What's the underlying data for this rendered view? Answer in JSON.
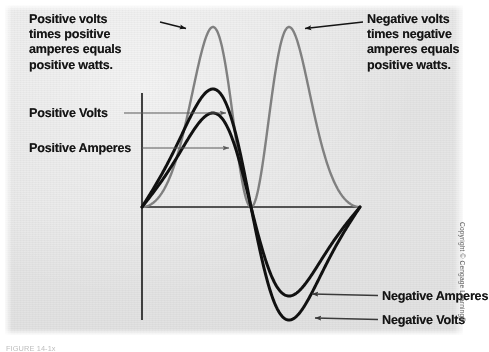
{
  "figure": {
    "background_color": "#e5e5e5",
    "page_color": "#ffffff",
    "copyright": "Copyright © Cengage Learning®",
    "caption": "FIGURE 14-1x"
  },
  "annotations": {
    "positive_watts": "Positive volts\ntimes positive\namperes equals\npositive watts.",
    "negative_watts": "Negative volts\ntimes negative\namperes equals\npositive watts.",
    "positive_volts": "Positive Volts",
    "positive_amperes": "Positive Amperes",
    "negative_amperes": "Negative Amperes",
    "negative_volts": "Negative Volts"
  },
  "chart_data": {
    "type": "line",
    "title": "",
    "xlabel": "",
    "ylabel": "",
    "grid": false,
    "legend": "annotations",
    "axes": {
      "origin_px": [
        142,
        207
      ],
      "x_axis_px": [
        142,
        360
      ],
      "y_axis_px": [
        93,
        320
      ],
      "x_range_deg": [
        0,
        360
      ],
      "y_range": [
        -1.15,
        1.15
      ],
      "axis_color": "#222222"
    },
    "series": [
      {
        "name": "Volts",
        "color": "#111111",
        "line_width_px": 3.0,
        "waveform": "sine",
        "amplitude": 1.0,
        "peak_px": [
          195,
          89
        ],
        "trough_px": [
          297,
          320
        ],
        "zero_crossings_px": [
          142,
          245,
          360
        ]
      },
      {
        "name": "Amperes",
        "color": "#111111",
        "line_width_px": 3.0,
        "waveform": "sine",
        "amplitude": 0.8,
        "peak_px": [
          195,
          113
        ],
        "trough_px": [
          293,
          296
        ],
        "zero_crossings_px": [
          142,
          245,
          360
        ]
      },
      {
        "name": "Watts",
        "color": "#808080",
        "line_width_px": 2.4,
        "waveform": "sine-squared (volts x amperes)",
        "amplitude": 1.0,
        "peaks_px": [
          [
            193,
            27
          ],
          [
            298,
            27
          ]
        ],
        "zero_crossings_px": [
          142,
          245,
          360
        ],
        "always_positive": true
      }
    ],
    "arrows": [
      {
        "label": "positive_watts",
        "from_px": [
          160,
          22
        ],
        "to_px": [
          189,
          29
        ],
        "color": "#141414"
      },
      {
        "label": "negative_watts",
        "from_px": [
          363,
          22
        ],
        "to_px": [
          302,
          29
        ],
        "color": "#141414"
      },
      {
        "label": "positive_volts",
        "from_px": [
          128,
          113
        ],
        "to_px": [
          229,
          113
        ],
        "color": "#5a5a5a"
      },
      {
        "label": "positive_amperes",
        "from_px": [
          143,
          148
        ],
        "to_px": [
          232,
          148
        ],
        "color": "#5a5a5a"
      },
      {
        "label": "negative_amperes",
        "from_px": [
          378,
          296
        ],
        "to_px": [
          309,
          294
        ],
        "color": "#3a3a3a"
      },
      {
        "label": "negative_volts",
        "from_px": [
          378,
          320
        ],
        "to_px": [
          312,
          318
        ],
        "color": "#3a3a3a"
      }
    ]
  }
}
